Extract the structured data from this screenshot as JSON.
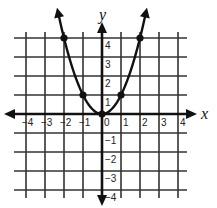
{
  "chart_data": {
    "type": "line",
    "title": "",
    "function": "y = x^2",
    "xlabel": "x",
    "ylabel": "y",
    "xlim": [
      -4,
      4
    ],
    "ylim": [
      -4,
      4
    ],
    "grid": true,
    "legend": null,
    "x_ticks": [
      "-4",
      "-3",
      "-2",
      "-1",
      "0",
      "1",
      "2",
      "3",
      "4"
    ],
    "y_ticks": [
      "-4",
      "-3",
      "-2",
      "-1",
      "1",
      "2",
      "3",
      "4"
    ],
    "series": [
      {
        "name": "parabola",
        "marked_points": [
          {
            "x": -2,
            "y": 4
          },
          {
            "x": -1,
            "y": 1
          },
          {
            "x": 0,
            "y": 0
          },
          {
            "x": 1,
            "y": 1
          },
          {
            "x": 2,
            "y": 4
          }
        ],
        "arrows_at_ends": true
      }
    ]
  },
  "labels": {
    "x_axis": "x",
    "y_axis": "y"
  },
  "colors": {
    "ink": "#111111",
    "grid": "#333333"
  }
}
